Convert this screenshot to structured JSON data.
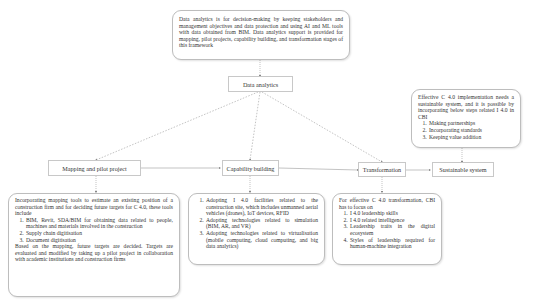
{
  "nodes": {
    "data_analytics": "Data analytics",
    "mapping": "Mapping and pilot project",
    "capability": "Capability building",
    "transformation": "Transformation",
    "sustainable": "Sustainable system"
  },
  "descriptions": {
    "data_analytics": "Data analytics is for decision-making by keeping stakeholders and management objectives and data protection and using AI and ML tools with data obtained from BIM. Data analytics support is provided for mapping, pilot projects, capability building, and transformation stages of this framework",
    "mapping": {
      "intro": "Incorporating mapping tools to estimate an existing position of a construction firm and for deciding future targets for C 4.0, these tools include",
      "items": [
        "BIM, Revit, SDA/BIM for obtaining data related to people, machines and materials involved in the construction",
        "Supply chain digitisation",
        "Document digitisation"
      ],
      "outro": "Based on the mapping, future targets are decided. Targets are evaluated and modified by taking up a pilot project in collaboration with academic institutions and construction firms"
    },
    "capability": {
      "items": [
        "Adopting I 4.0 facilities related to the construction site, which includes unmanned aerial vehicles (drones), IoT devices, RFID",
        "Adopting technologies related to simulation (BIM, AR, and VR)",
        "Adopting technologies related to virtualisation (mobile computing, cloud computing, and big data analytics)"
      ]
    },
    "transformation": {
      "intro": "For effective C 4.0 transformation, CBI has to focus on",
      "items": [
        "I 4.0 leadership skills",
        "I 4.0 related intelligence",
        "Leadership traits in the digital ecosystem",
        "Styles of leadership required for human-machine integration"
      ]
    },
    "sustainable": {
      "intro": "Effective C 4.0 implementation needs a sustainable system, and it is possible by incorporating below steps related I 4.0 in CBI",
      "items": [
        "Making partnerships",
        "Incorporating standards",
        "Keeping value addition"
      ]
    }
  },
  "colors": {
    "border": "#bdbdbd",
    "line": "#9a9a9a",
    "text": "#333333"
  }
}
